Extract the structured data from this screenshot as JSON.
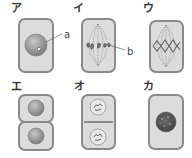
{
  "diagram": {
    "title": "",
    "panels": [
      {
        "id": "a",
        "label": "ア",
        "stage": "interphase",
        "annotation": "a"
      },
      {
        "id": "i",
        "label": "イ",
        "stage": "metaphase-forming",
        "annotation": "b"
      },
      {
        "id": "u",
        "label": "ウ",
        "stage": "metaphase"
      },
      {
        "id": "e",
        "label": "エ",
        "stage": "two daughter cells"
      },
      {
        "id": "o",
        "label": "オ",
        "stage": "telophase (cell plate)"
      },
      {
        "id": "ka",
        "label": "カ",
        "stage": "prophase (condensed nucleus)"
      }
    ],
    "annotations": {
      "a": "a",
      "b": "b"
    },
    "colors": {
      "cell_fill": "#dcdcdc",
      "cell_border": "#8a8a8a",
      "nucleus": "#9a9a9a",
      "chromosome": "#6b6b6b",
      "spindle": "#777777"
    }
  }
}
